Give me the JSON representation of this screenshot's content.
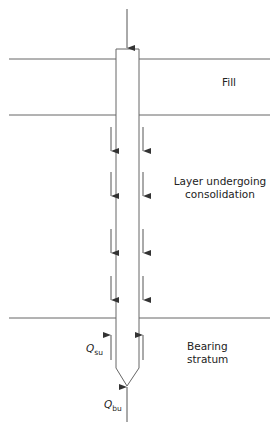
{
  "diagram": {
    "title": "",
    "layers": [
      {
        "name": "fill",
        "label_lines": [
          "Fill"
        ]
      },
      {
        "name": "consolidating-layer",
        "label_lines": [
          "Layer undergoing",
          "consolidation"
        ]
      },
      {
        "name": "bearing-stratum",
        "label_lines": [
          "Bearing",
          "stratum"
        ]
      }
    ],
    "forces": {
      "shaft_resistance": {
        "symbol": "Q",
        "subscript": "su"
      },
      "base_resistance": {
        "symbol": "Q",
        "subscript": "bu"
      }
    },
    "negative_skin_friction_arrow_pairs": 4,
    "positive_skin_friction_arrow_pairs": 1,
    "colors": {
      "line": "#555555",
      "text": "#222222"
    }
  }
}
